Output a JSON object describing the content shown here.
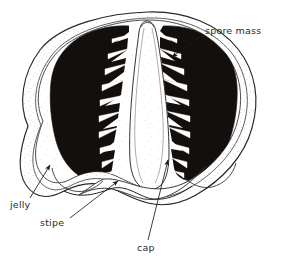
{
  "figure": {
    "background_color": "#ffffff",
    "ink_color": "#1a1a1a",
    "spore_mass_color": "#120f0d",
    "jelly_fill_color": "#fdfdfd",
    "stipe_fill_color": "#ffffff"
  },
  "labels": [
    {
      "id": "spore-mass",
      "text": "spore mass",
      "x": 205,
      "y": 31,
      "anchor": "start",
      "leader": {
        "x1": 201,
        "y1": 36,
        "x2": 172,
        "y2": 57,
        "arrow": true
      }
    },
    {
      "id": "jelly",
      "text": "jelly",
      "x": 10,
      "y": 205,
      "anchor": "start",
      "leader": {
        "x1": 30,
        "y1": 198,
        "x2": 50,
        "y2": 165,
        "arrow": true
      }
    },
    {
      "id": "stipe",
      "text": "stipe",
      "x": 40,
      "y": 223,
      "anchor": "start",
      "leader": {
        "x1": 70,
        "y1": 218,
        "x2": 118,
        "y2": 181,
        "arrow": true
      }
    },
    {
      "id": "cap",
      "text": "cap",
      "x": 137,
      "y": 249,
      "anchor": "start",
      "leader": {
        "x1": 148,
        "y1": 240,
        "x2": 168,
        "y2": 160,
        "arrow": true
      }
    }
  ],
  "structures": {
    "jelly": {
      "name": "jelly",
      "description": "stippled outer gelatinous layer enclosing the whole egg"
    },
    "spore_mass_left": {
      "name": "spore mass (left)",
      "description": "dark gleba with comb-like gill teeth pointing toward the central stipe",
      "teeth_count": 10
    },
    "spore_mass_right": {
      "name": "spore mass (right)",
      "description": "dark gleba with comb-like gill teeth pointing toward the central stipe",
      "teeth_count": 10
    },
    "stipe": {
      "name": "stipe",
      "description": "pale central column, narrow at the apex and widening toward the base"
    },
    "cap": {
      "name": "cap",
      "description": "pale tissue at the base of the stipe beneath the spore masses"
    }
  }
}
